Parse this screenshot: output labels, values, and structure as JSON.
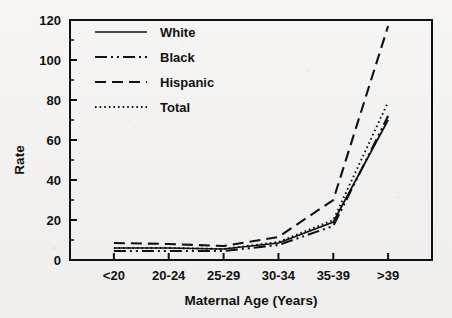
{
  "chart_data": {
    "type": "line",
    "title": "",
    "xlabel": "Maternal Age (Years)",
    "ylabel": "Rate",
    "categories": [
      "<20",
      "20-24",
      "25-29",
      "30-34",
      "35-39",
      ">39"
    ],
    "ylim": [
      0,
      120
    ],
    "ytick_labels": [
      "0",
      "20",
      "40",
      "60",
      "80",
      "100",
      "120"
    ],
    "ytick_values": [
      0,
      20,
      40,
      60,
      80,
      100,
      120
    ],
    "yminor_step": 10,
    "grid": false,
    "legend_position": "upper left (inside axes)",
    "series": [
      {
        "name": "White",
        "style": "solid",
        "values": [
          6,
          6,
          5.5,
          8.5,
          19,
          70
        ]
      },
      {
        "name": "Black",
        "style": "dash-dot-dot",
        "values": [
          4.5,
          4.5,
          4.5,
          7.5,
          17,
          72
        ]
      },
      {
        "name": "Hispanic",
        "style": "dashed",
        "values": [
          8.5,
          8,
          7,
          11.5,
          30,
          117
        ]
      },
      {
        "name": "Total",
        "style": "dotted",
        "values": [
          6,
          6,
          5.5,
          9,
          20,
          79
        ]
      }
    ]
  },
  "colors": {
    "ink": "#111111",
    "paper": "#f4f3f1"
  }
}
